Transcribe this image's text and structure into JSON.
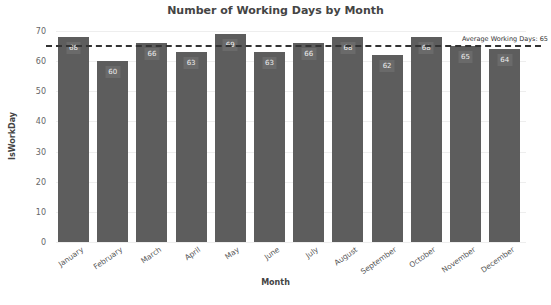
{
  "chart_data": {
    "type": "bar",
    "title": "Number of Working Days by Month",
    "xlabel": "Month",
    "ylabel": "IsWorkDay",
    "categories": [
      "January",
      "February",
      "March",
      "April",
      "May",
      "June",
      "July",
      "August",
      "September",
      "October",
      "November",
      "December"
    ],
    "values": [
      68,
      60,
      66,
      63,
      69,
      63,
      66,
      68,
      62,
      68,
      65,
      64
    ],
    "ylim": [
      0,
      70
    ],
    "yticks": [
      0,
      10,
      20,
      30,
      40,
      50,
      60,
      70
    ],
    "grid": true,
    "bar_color": "#5d5d5d",
    "annotations": [
      {
        "type": "hline",
        "y": 65,
        "style": "dashed",
        "label": "Average Working Days: 65"
      }
    ]
  }
}
